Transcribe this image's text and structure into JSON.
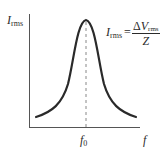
{
  "diagram": {
    "y_axis": {
      "symbol": "I",
      "subscript": "rms"
    },
    "x_axis": {
      "symbol": "f"
    },
    "peak_marker": {
      "symbol": "f",
      "subscript": "0"
    },
    "equation": {
      "lhs_symbol": "I",
      "lhs_subscript": "rms",
      "equals": "=",
      "numerator_prefix": "Δ",
      "numerator_symbol": "V",
      "numerator_subscript": "rms",
      "denominator": "Z"
    },
    "colors": {
      "curve": "#2a2a2a",
      "axis": "#555555",
      "dashed": "#888888"
    }
  }
}
